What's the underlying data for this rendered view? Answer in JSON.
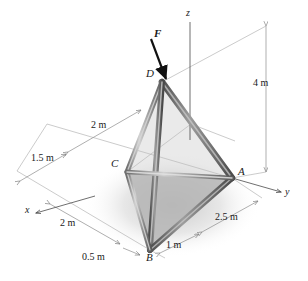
{
  "figure": {
    "type": "statics-free-body-diagram",
    "background_color": "#ffffff",
    "member_color": "#7a7a7a",
    "member_dark_color": "#4a4a4a",
    "base_face_color": "#b9b9b9",
    "dimension_line_color": "#8c8c8c",
    "axis_color": "#555555",
    "text_color": "#1a1a1a"
  },
  "vertices": [
    {
      "name": "D",
      "label": "D",
      "role": "apex",
      "x_px": 162,
      "y_px": 82
    },
    {
      "name": "C",
      "label": "C",
      "role": "base-support",
      "x_px": 127,
      "y_px": 172
    },
    {
      "name": "A",
      "label": "A",
      "role": "base-support",
      "x_px": 232,
      "y_px": 178
    },
    {
      "name": "B",
      "label": "B",
      "role": "base-support",
      "x_px": 150,
      "y_px": 250
    }
  ],
  "axes": [
    {
      "name": "z",
      "label": "z",
      "direction": "vertical-up",
      "label_x": 189,
      "label_y": 14
    },
    {
      "name": "y",
      "label": "y",
      "direction": "down-right",
      "label_x": 287,
      "label_y": 193
    },
    {
      "name": "x",
      "label": "x",
      "direction": "down-left",
      "label_x": 27,
      "label_y": 210
    }
  ],
  "force": {
    "symbol": "F",
    "label": "F",
    "applied_at": "D",
    "direction": "down-and-right",
    "label_x": 159,
    "label_y": 35
  },
  "dimensions": [
    {
      "id": "height",
      "label": "4 m",
      "value": 4,
      "unit": "m",
      "measures": "vertical height of D above base plane",
      "label_x": 262,
      "label_y": 84
    },
    {
      "id": "upper-2m",
      "label": "2 m",
      "value": 2,
      "unit": "m",
      "measures": "distance along upper dimension line toward D",
      "label_x": 101,
      "label_y": 126
    },
    {
      "id": "one-point-five",
      "label": "1.5 m",
      "value": 1.5,
      "unit": "m",
      "measures": "offset along dimension line to C",
      "label_x": 38,
      "label_y": 159
    },
    {
      "id": "lower-2m",
      "label": "2 m",
      "value": 2,
      "unit": "m",
      "measures": "distance along x direction to B",
      "label_x": 69,
      "label_y": 224
    },
    {
      "id": "half-meter",
      "label": "0.5 m",
      "value": 0.5,
      "unit": "m",
      "measures": "short offset at B",
      "label_x": 95,
      "label_y": 258
    },
    {
      "id": "one-meter",
      "label": "1 m",
      "value": 1,
      "unit": "m",
      "measures": "offset from B along y",
      "label_x": 175,
      "label_y": 246
    },
    {
      "id": "two-point-five",
      "label": "2.5 m",
      "value": 2.5,
      "unit": "m",
      "measures": "distance from B region to A along y",
      "label_x": 228,
      "label_y": 218
    }
  ],
  "members": [
    {
      "from": "D",
      "to": "A",
      "kind": "leg"
    },
    {
      "from": "D",
      "to": "B",
      "kind": "leg"
    },
    {
      "from": "D",
      "to": "C",
      "kind": "leg"
    },
    {
      "from": "A",
      "to": "B",
      "kind": "base-edge"
    },
    {
      "from": "B",
      "to": "C",
      "kind": "base-edge"
    },
    {
      "from": "C",
      "to": "A",
      "kind": "base-edge"
    }
  ]
}
